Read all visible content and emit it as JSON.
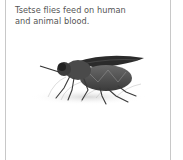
{
  "card": {
    "caption": "Tsetse flies feed on human and animal blood.",
    "illustration": "tsetse-fly-illustration"
  },
  "colors": {
    "border": "#c8c8c8",
    "text": "#555555",
    "background": "#ffffff"
  }
}
